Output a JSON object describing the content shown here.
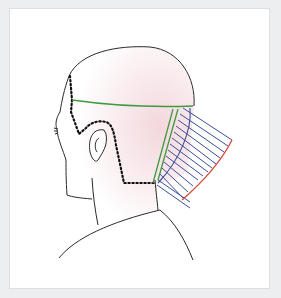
{
  "diagram": {
    "elements": [
      {
        "name": "head-outline",
        "description": "Bald head profile with ear, neck and shoulder"
      },
      {
        "name": "hairline",
        "description": "Dotted black hairline around temple, ear and nape"
      },
      {
        "name": "horizontal-section-line",
        "description": "Green horizontal parting across the head"
      },
      {
        "name": "vertical-section-lines",
        "description": "Green vertical partings behind the ear"
      },
      {
        "name": "elevated-hair-strands",
        "description": "Blue lines showing hair combed out at an angle"
      },
      {
        "name": "cut-guideline",
        "description": "Red diagonal cutting line across the strand ends"
      }
    ],
    "colors": {
      "background": "#eceef0",
      "panel": "#ffffff",
      "outline": "#2a2a2a",
      "skin_shade": "#f4dfe2",
      "section_line": "#3f9a3f",
      "strands": "#3a4f9a",
      "cut_line": "#d9473a",
      "hairline": "#111111"
    }
  }
}
